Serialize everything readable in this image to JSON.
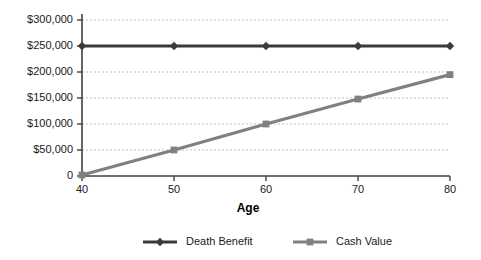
{
  "chart_data": {
    "type": "line",
    "title": "",
    "xlabel": "Age",
    "ylabel": "",
    "x": [
      40,
      50,
      60,
      70,
      80
    ],
    "categories": [
      "40",
      "50",
      "60",
      "70",
      "80"
    ],
    "xlim": [
      40,
      80
    ],
    "ylim": [
      0,
      300000
    ],
    "grid": true,
    "legend_position": "bottom",
    "series": [
      {
        "name": "Death Benefit",
        "values": [
          250000,
          250000,
          250000,
          250000,
          250000
        ],
        "color": "#3a3a3a",
        "marker": "diamond"
      },
      {
        "name": "Cash Value",
        "values": [
          2000,
          50000,
          100000,
          148000,
          195000
        ],
        "color": "#808080",
        "marker": "square"
      }
    ],
    "ytick_labels": [
      "$300,000",
      "$250,000",
      "$200,000",
      "$150,000",
      "$100,000",
      "$50,000",
      "0"
    ],
    "ytick_values": [
      300000,
      250000,
      200000,
      150000,
      100000,
      50000,
      0
    ],
    "xtick_labels": [
      "40",
      "50",
      "60",
      "70",
      "80"
    ],
    "xtick_values": [
      40,
      50,
      60,
      70,
      80
    ]
  },
  "axis": {
    "x_title": "Age"
  },
  "legend": {
    "items": [
      {
        "label": "Death Benefit"
      },
      {
        "label": "Cash Value"
      }
    ]
  },
  "colors": {
    "death_benefit": "#3a3a3a",
    "cash_value": "#808080",
    "gridline": "#bfbfbf",
    "axis": "#404040",
    "background": "#ffffff"
  }
}
